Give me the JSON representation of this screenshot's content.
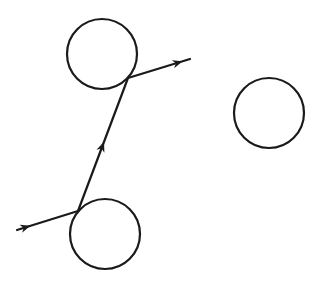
{
  "diagram": {
    "type": "trajectory-scattering",
    "colors": {
      "stroke": "#1a1a1a",
      "background": "#ffffff"
    },
    "nodes": [
      {
        "id": "circle-top",
        "label": ""
      },
      {
        "id": "circle-bottom",
        "label": ""
      },
      {
        "id": "circle-right",
        "label": ""
      }
    ],
    "path": {
      "segments": [
        {
          "id": "incoming",
          "from": "outside",
          "to": "circle-bottom",
          "arrow": "forward"
        },
        {
          "id": "between",
          "from": "circle-bottom",
          "to": "circle-top",
          "arrow": "forward"
        },
        {
          "id": "outgoing",
          "from": "circle-top",
          "to": "outside",
          "arrow": "forward"
        }
      ]
    }
  }
}
